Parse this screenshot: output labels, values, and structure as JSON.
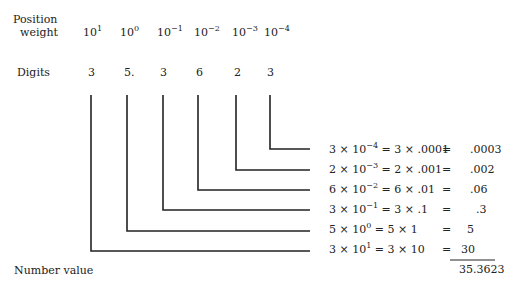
{
  "labels": {
    "position_line1": "Position",
    "position_line2": "weight",
    "digits": "Digits",
    "number_value": "Number value"
  },
  "weights": [
    {
      "base": "10",
      "exp": "1"
    },
    {
      "base": "10",
      "exp": "0"
    },
    {
      "base": "10",
      "exp": "−1"
    },
    {
      "base": "10",
      "exp": "−2"
    },
    {
      "base": "10",
      "exp": "−3"
    },
    {
      "base": "10",
      "exp": "−4"
    }
  ],
  "digits": [
    "3",
    "5.",
    "3",
    "6",
    "2",
    "3"
  ],
  "rows": [
    {
      "d": "3",
      "exp": "−4",
      "eq2": "= 3 × .0001",
      "eq": "=",
      "val": ".0003"
    },
    {
      "d": "2",
      "exp": "−3",
      "eq2": "= 2 × .001",
      "eq": "=",
      "val": ".002"
    },
    {
      "d": "6",
      "exp": "−2",
      "eq2": "= 6 × .01",
      "eq": "=",
      "val": ".06"
    },
    {
      "d": "3",
      "exp": "−1",
      "eq2": "= 3 × .1",
      "eq": "=",
      "val": ".3"
    },
    {
      "d": "5",
      "exp": "0",
      "eq2": "=  5 × 1",
      "eq": "=",
      "val": "5"
    },
    {
      "d": "3",
      "exp": "1",
      "eq2": "=  3 × 10",
      "eq": "=",
      "val": "30"
    }
  ],
  "total": "35.3623",
  "colors": {
    "ink": "#222222"
  }
}
